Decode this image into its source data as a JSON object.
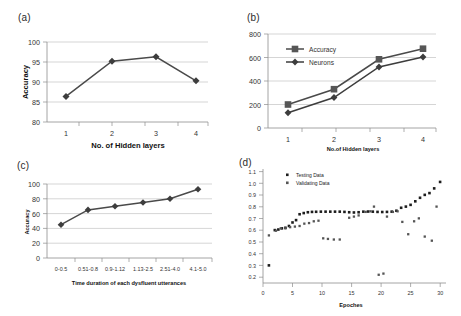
{
  "figure": {
    "panels": [
      {
        "tag": "(a)"
      },
      {
        "tag": "(b)"
      },
      {
        "tag": "(c)"
      },
      {
        "tag": "(d)"
      }
    ]
  },
  "chart_data": [
    {
      "panel": "(a)",
      "type": "line",
      "title": "",
      "xlabel": "No. of Hidden layers",
      "ylabel": "Accuracy",
      "categories": [
        "1",
        "2",
        "3",
        "4"
      ],
      "x": [
        1,
        2,
        3,
        4
      ],
      "values": [
        86.4,
        95.2,
        96.3,
        90.3
      ],
      "xlim": [
        0.5,
        4.5
      ],
      "ylim": [
        80,
        100
      ],
      "yticks": [
        80,
        85,
        90,
        95,
        100
      ],
      "xticks": [
        "1",
        "2",
        "3",
        "4"
      ],
      "grid": true,
      "legend": "none",
      "marker": "diamond"
    },
    {
      "panel": "(b)",
      "type": "line",
      "title": "",
      "xlabel": "No.of Hidden layers",
      "ylabel": "",
      "categories": [
        "1",
        "2",
        "3",
        "4"
      ],
      "x": [
        1,
        2,
        3,
        4
      ],
      "series": [
        {
          "name": "Accuracy",
          "values": [
            200,
            330,
            585,
            675
          ],
          "marker": "square"
        },
        {
          "name": "Neurons",
          "values": [
            130,
            260,
            520,
            605
          ],
          "marker": "diamond"
        }
      ],
      "xlim": [
        0.5,
        4.5
      ],
      "ylim": [
        0,
        800
      ],
      "yticks": [
        0,
        200,
        400,
        600,
        800
      ],
      "xticks": [
        "1",
        "2",
        "3",
        "4"
      ],
      "grid": true,
      "legend": "upper left"
    },
    {
      "panel": "(c)",
      "type": "line",
      "title": "",
      "xlabel": "Time duration of each dysfluent utterances",
      "ylabel": "Accuracy",
      "categories": [
        "0-0.5",
        "0.51-0.8",
        "0.9-1.12",
        "1.13-2.5",
        "2.51-4.0",
        "4.1-5.0"
      ],
      "values": [
        45,
        65,
        70,
        75,
        80,
        93
      ],
      "ylim": [
        0,
        100
      ],
      "yticks": [
        0,
        20,
        40,
        60,
        80,
        100
      ],
      "grid": true,
      "legend": "none",
      "marker": "diamond"
    },
    {
      "panel": "(d)",
      "type": "scatter",
      "title": "",
      "xlabel": "Epoches",
      "ylabel": "",
      "xlim": [
        0,
        31
      ],
      "ylim": [
        0.15,
        1.12
      ],
      "xticks": [
        0,
        5,
        10,
        15,
        20,
        25,
        30
      ],
      "yticks": [
        0.2,
        0.3,
        0.4,
        0.5,
        0.6,
        0.7,
        0.8,
        0.9,
        1.0,
        1.1
      ],
      "ytick_labels": [
        "0.2",
        "0.3",
        "0.4",
        "0.5",
        "0.6",
        "0.7",
        "0.8",
        "0.9",
        "1.0",
        "1.1"
      ],
      "grid": false,
      "legend": "upper left",
      "series": [
        {
          "name": "Testing Data",
          "marker": "filled-square",
          "points": [
            [
              1,
              0.3
            ],
            [
              2,
              0.6
            ],
            [
              2.6,
              0.605
            ],
            [
              3.2,
              0.615
            ],
            [
              3.8,
              0.62
            ],
            [
              4.4,
              0.635
            ],
            [
              5.0,
              0.665
            ],
            [
              5.6,
              0.685
            ],
            [
              6.2,
              0.735
            ],
            [
              6.9,
              0.745
            ],
            [
              7.6,
              0.752
            ],
            [
              8.3,
              0.755
            ],
            [
              9.0,
              0.756
            ],
            [
              9.8,
              0.757
            ],
            [
              10.6,
              0.757
            ],
            [
              11.4,
              0.757
            ],
            [
              12.2,
              0.757
            ],
            [
              13.0,
              0.757
            ],
            [
              13.8,
              0.755
            ],
            [
              14.6,
              0.752
            ],
            [
              15.4,
              0.75
            ],
            [
              16.2,
              0.752
            ],
            [
              17.0,
              0.757
            ],
            [
              17.8,
              0.758
            ],
            [
              18.6,
              0.757
            ],
            [
              19.4,
              0.755
            ],
            [
              20.2,
              0.754
            ],
            [
              21.0,
              0.755
            ],
            [
              21.8,
              0.757
            ],
            [
              22.6,
              0.765
            ],
            [
              23.4,
              0.79
            ],
            [
              24.2,
              0.8
            ],
            [
              25.0,
              0.815
            ],
            [
              25.8,
              0.845
            ],
            [
              26.6,
              0.875
            ],
            [
              27.4,
              0.9
            ],
            [
              28.2,
              0.915
            ],
            [
              29.0,
              0.955
            ],
            [
              30.0,
              1.01
            ]
          ]
        },
        {
          "name": "Validating Data",
          "marker": "open-square",
          "points": [
            [
              1,
              0.555
            ],
            [
              2.2,
              0.595
            ],
            [
              3.0,
              0.615
            ],
            [
              3.8,
              0.615
            ],
            [
              4.6,
              0.625
            ],
            [
              5.4,
              0.63
            ],
            [
              6.2,
              0.635
            ],
            [
              7.0,
              0.655
            ],
            [
              7.8,
              0.66
            ],
            [
              8.6,
              0.675
            ],
            [
              9.4,
              0.68
            ],
            [
              10.2,
              0.53
            ],
            [
              11.0,
              0.525
            ],
            [
              12.0,
              0.52
            ],
            [
              13.0,
              0.52
            ],
            [
              14.6,
              0.705
            ],
            [
              15.4,
              0.715
            ],
            [
              16.2,
              0.725
            ],
            [
              17.4,
              0.755
            ],
            [
              18.2,
              0.76
            ],
            [
              18.8,
              0.8
            ],
            [
              19.6,
              0.22
            ],
            [
              20.4,
              0.23
            ],
            [
              21.0,
              0.715
            ],
            [
              22.0,
              0.755
            ],
            [
              22.8,
              0.76
            ],
            [
              23.6,
              0.67
            ],
            [
              24.6,
              0.565
            ],
            [
              25.6,
              0.675
            ],
            [
              26.4,
              0.7
            ],
            [
              27.4,
              0.545
            ],
            [
              28.6,
              0.51
            ],
            [
              29.4,
              0.8
            ]
          ]
        }
      ]
    }
  ]
}
